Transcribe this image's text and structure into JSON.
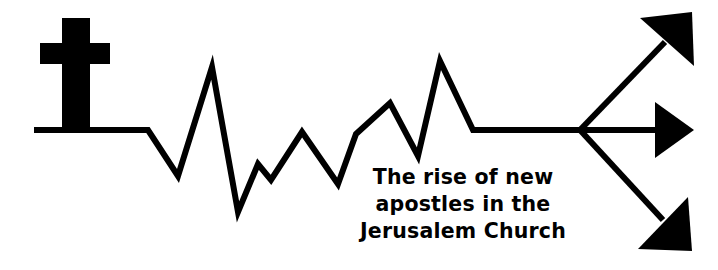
{
  "canvas": {
    "width": 718,
    "height": 270,
    "background_color": "#ffffff",
    "ink_color": "#000000"
  },
  "graphic": {
    "name": "book-cover-logo",
    "description": "Black line-art logo: a Christian cross at the left joined to a jagged heartbeat/stock-chart line that rises and splits into three arrows pointing up-right, right, and down-right.",
    "elements": {
      "cross": {
        "name": "christian-cross-icon",
        "stem": {
          "x": 62,
          "y": 18,
          "width": 28,
          "height": 114
        },
        "crossbar": {
          "x": 40,
          "y": 43,
          "width": 70,
          "height": 21
        }
      },
      "baseline": {
        "name": "left-baseline-segment",
        "from": {
          "x": 34,
          "y": 130
        },
        "to": {
          "x": 148,
          "y": 130
        }
      },
      "zigzag": {
        "name": "jagged-growth-line",
        "stroke_width": 6,
        "points": [
          {
            "x": 148,
            "y": 130
          },
          {
            "x": 178,
            "y": 176
          },
          {
            "x": 212,
            "y": 67
          },
          {
            "x": 238,
            "y": 212
          },
          {
            "x": 258,
            "y": 164
          },
          {
            "x": 271,
            "y": 180
          },
          {
            "x": 302,
            "y": 132
          },
          {
            "x": 338,
            "y": 184
          },
          {
            "x": 356,
            "y": 134
          },
          {
            "x": 390,
            "y": 103
          },
          {
            "x": 418,
            "y": 156
          },
          {
            "x": 440,
            "y": 61
          },
          {
            "x": 473,
            "y": 130
          },
          {
            "x": 580,
            "y": 130
          }
        ]
      },
      "arrows": [
        {
          "name": "arrow-up-right",
          "direction": "up-right",
          "from": {
            "x": 580,
            "y": 130
          },
          "to": {
            "x": 692,
            "y": 12
          }
        },
        {
          "name": "arrow-right",
          "direction": "right",
          "from": {
            "x": 580,
            "y": 130
          },
          "to": {
            "x": 692,
            "y": 130
          }
        },
        {
          "name": "arrow-down-right",
          "direction": "down-right",
          "from": {
            "x": 580,
            "y": 130
          },
          "to": {
            "x": 692,
            "y": 251
          }
        }
      ]
    }
  },
  "caption": {
    "name": "title-caption",
    "full_text": "The rise of new apostles in the Jerusalem Church",
    "align": "center",
    "lines": [
      {
        "text": "The rise of new",
        "x": 463,
        "y": 184
      },
      {
        "text": "apostles in the",
        "x": 463,
        "y": 211
      },
      {
        "text": "Jerusalem Church",
        "x": 463,
        "y": 238
      }
    ]
  }
}
